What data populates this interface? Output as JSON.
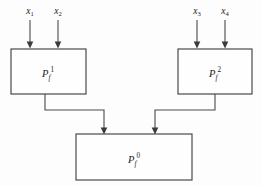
{
  "diagram": {
    "type": "block-diagram",
    "background_color": "#fdfdfd",
    "line_color": "#4a4a4a",
    "box_fill": "#fefefe",
    "box_stroke": "#3a3a3a",
    "text_color": "#1a1a1a",
    "inputs": [
      {
        "id": "x1",
        "base": "x",
        "sub": "1",
        "x": 30,
        "label_y": 14,
        "arrow_from_y": 20,
        "arrow_to_y": 48
      },
      {
        "id": "x2",
        "base": "x",
        "sub": "2",
        "x": 58,
        "label_y": 14,
        "arrow_from_y": 20,
        "arrow_to_y": 48
      },
      {
        "id": "x3",
        "base": "x",
        "sub": "3",
        "x": 197,
        "label_y": 14,
        "arrow_from_y": 20,
        "arrow_to_y": 48
      },
      {
        "id": "x4",
        "base": "x",
        "sub": "4",
        "x": 225,
        "label_y": 14,
        "arrow_from_y": 20,
        "arrow_to_y": 48
      }
    ],
    "nodes": [
      {
        "id": "pf1",
        "base": "P",
        "sub": "f",
        "sup": "1",
        "x": 11,
        "y": 49,
        "width": 75,
        "height": 45,
        "label_cx": 48,
        "label_cy": 74
      },
      {
        "id": "pf2",
        "base": "P",
        "sub": "f",
        "sup": "2",
        "x": 178,
        "y": 49,
        "width": 74,
        "height": 45,
        "label_cx": 215,
        "label_cy": 74
      },
      {
        "id": "pf0",
        "base": "P",
        "sub": "f",
        "sup": "0",
        "x": 76,
        "y": 134,
        "width": 116,
        "height": 46,
        "label_cx": 134,
        "label_cy": 160
      }
    ],
    "connectors": [
      {
        "id": "pf1-to-pf0",
        "from": "pf1",
        "to": "pf0",
        "path": "M 45 94 L 45 110 L 104 110 L 104 130",
        "arrow_x": 104,
        "arrow_y": 134
      },
      {
        "id": "pf2-to-pf0",
        "from": "pf2",
        "to": "pf0",
        "path": "M 215 94 L 215 110 L 155 110 L 155 130",
        "arrow_x": 155,
        "arrow_y": 134
      }
    ],
    "arrow_half_width": 3.4,
    "arrow_length": 6.5
  }
}
